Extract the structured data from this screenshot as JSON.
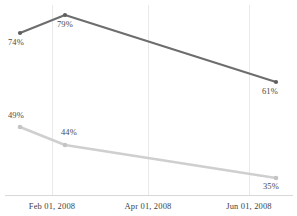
{
  "chart_data": {
    "type": "line",
    "title": "",
    "subtitle": "",
    "xlabel": "",
    "ylabel": "",
    "grid": "vertical-only",
    "legend_position": "none",
    "x": [
      "Feb 01, 2008",
      "Apr 01, 2008",
      "Jun 01, 2008"
    ],
    "tick_labels": [
      "Feb 01, 2008",
      "Apr 01, 2008",
      "Jun 01, 2008"
    ],
    "ylim": [
      0,
      100
    ],
    "series": [
      {
        "name": "primary",
        "color": "#6d6d6d",
        "values": [
          74,
          79,
          61
        ],
        "labels": [
          "74%",
          "79%",
          "61%"
        ],
        "points": [
          {
            "label": "74%",
            "value": 74,
            "cx": 20,
            "cy": 33,
            "lx": 8,
            "ly": 38
          },
          {
            "label": "79%",
            "value": 79,
            "cx": 65,
            "cy": 15,
            "lx": 57,
            "ly": 20
          },
          {
            "label": "61%",
            "value": 61,
            "cx": 276,
            "cy": 82,
            "lx": 262,
            "ly": 87
          }
        ]
      },
      {
        "name": "secondary",
        "color": "#cfcfcf",
        "values": [
          49,
          44,
          35
        ],
        "labels": [
          "49%",
          "44%",
          "35%"
        ],
        "points": [
          {
            "label": "49%",
            "value": 49,
            "cx": 20,
            "cy": 127,
            "lx": 8,
            "ly": 111
          },
          {
            "label": "44%",
            "value": 44,
            "cx": 65,
            "cy": 145,
            "lx": 61,
            "ly": 128
          },
          {
            "label": "35%",
            "value": 35,
            "cx": 276,
            "cy": 178,
            "lx": 263,
            "ly": 182
          }
        ]
      }
    ],
    "gridlines_x": [
      52,
      148,
      249
    ],
    "axis_baseline_y": 195,
    "colors": {
      "primary": "#6d6d6d",
      "secondary": "#cfcfcf",
      "grid": "#e9e9e9",
      "axis": "#d8d8d8",
      "label_text": "#4a4a4a",
      "tick_text": "#3f3f3f",
      "background": "#ffffff"
    }
  },
  "ticks": [
    {
      "label": "Feb 01, 2008",
      "x": 52
    },
    {
      "label": "Apr 01, 2008",
      "x": 148
    },
    {
      "label": "Jun 01, 2008",
      "x": 249
    }
  ]
}
